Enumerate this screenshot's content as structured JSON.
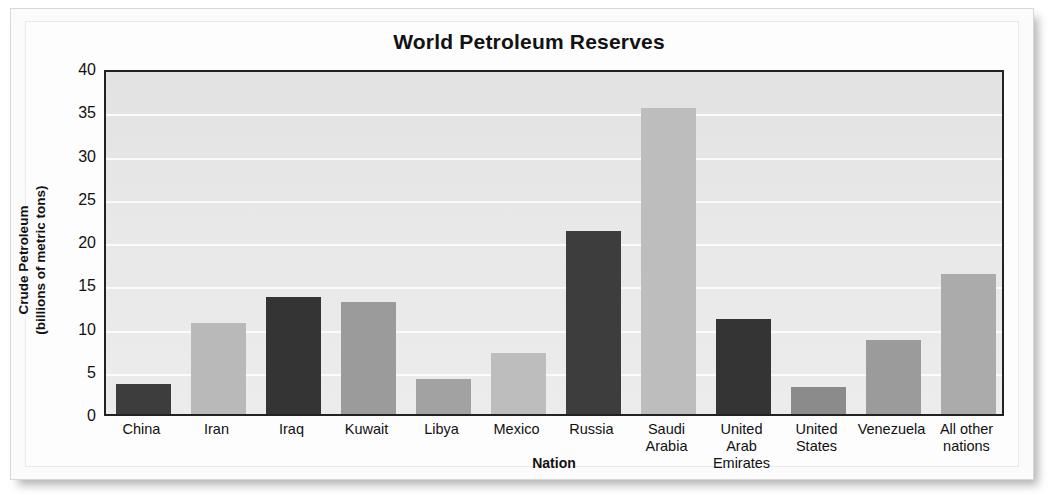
{
  "figure": {
    "title": "World Petroleum Reserves"
  },
  "chart_data": {
    "type": "bar",
    "title": "World Petroleum Reserves",
    "xlabel": "Nation",
    "ylabel": "Crude Petroleum\n(billions of metric tons)",
    "ylabel_line1": "Crude Petroleum",
    "ylabel_line2": "(billions of metric tons)",
    "ylim": [
      0,
      40
    ],
    "ytick_values": [
      0,
      5,
      10,
      15,
      20,
      25,
      30,
      35,
      40
    ],
    "ytick_labels": [
      "0",
      "5",
      "10",
      "15",
      "20",
      "25",
      "30",
      "35",
      "40"
    ],
    "grid": true,
    "grid_axis": "y",
    "legend": "none",
    "categories": [
      "China",
      "Iran",
      "Iraq",
      "Kuwait",
      "Libya",
      "Mexico",
      "Russia",
      "Saudi Arabia",
      "United Arab Emirates",
      "United States",
      "Venezuela",
      "All other nations"
    ],
    "category_labels_wrapped": [
      [
        "China"
      ],
      [
        "Iran"
      ],
      [
        "Iraq"
      ],
      [
        "Kuwait"
      ],
      [
        "Libya"
      ],
      [
        "Mexico"
      ],
      [
        "Russia"
      ],
      [
        "Saudi",
        "Arabia"
      ],
      [
        "United Arab",
        "Emirates"
      ],
      [
        "United",
        "States"
      ],
      [
        "Venezuela"
      ],
      [
        "All other",
        "nations"
      ]
    ],
    "values": [
      3.5,
      10.5,
      13.5,
      12.9,
      4.1,
      7.0,
      21.2,
      35.4,
      11.0,
      3.1,
      8.5,
      16.2
    ],
    "bar_colors": [
      "#3d3d3d",
      "#b9b9b9",
      "#343434",
      "#9b9b9b",
      "#a2a2a2",
      "#bdbdbd",
      "#3d3d3d",
      "#bdbdbd",
      "#343434",
      "#8b8b8b",
      "#9b9b9b",
      "#ababab"
    ]
  },
  "style": {
    "plot_background": "#e9e9e9",
    "gridline_color": "#fbfbfb",
    "axis_color": "#222222",
    "text_color": "#111111",
    "page_background": "#ffffff"
  }
}
